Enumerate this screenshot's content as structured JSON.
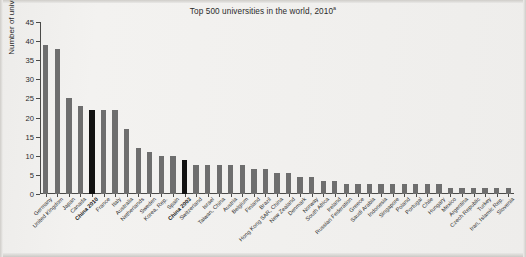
{
  "chart_data": {
    "type": "bar",
    "title": "Top 500 universities in the world, 2010",
    "title_superscript": "a",
    "xlabel": "",
    "ylabel": "Number of universities",
    "ylim": [
      0,
      45
    ],
    "ytick_labels": [
      "0",
      "5",
      "10",
      "15",
      "20",
      "25",
      "30",
      "35",
      "40",
      "45"
    ],
    "ytick_values": [
      0,
      5,
      10,
      15,
      20,
      25,
      30,
      35,
      40,
      45
    ],
    "grid": false,
    "legend": "none",
    "bar_color": "#6e6e6e",
    "highlight_color": "#121212",
    "categories": [
      "Germany",
      "United Kingdom",
      "Japan",
      "Canada",
      "China 2010",
      "France",
      "Italy",
      "Australia",
      "Netherlands",
      "Sweden",
      "Korea, Rep.",
      "Spain",
      "China 2003",
      "Switzerland",
      "Israel",
      "Taiwan, China",
      "Austria",
      "Belgium",
      "Finland",
      "Brazil",
      "Hong Kong SAR, China",
      "New Zealand",
      "Denmark",
      "Norway",
      "South Africa",
      "Ireland",
      "Russian Federation",
      "Greece",
      "Saudi Arabia",
      "Indonesia",
      "Singapore",
      "Poland",
      "Portugal",
      "Chile",
      "Hungary",
      "Mexico",
      "Argentina",
      "Czech Republic",
      "Turkey",
      "Iran, Islamic Rep.",
      "Slovenia"
    ],
    "values": [
      39,
      38,
      25,
      23,
      22,
      22,
      22,
      17,
      12,
      11,
      10,
      10,
      9,
      7.5,
      7.5,
      7.5,
      7.5,
      7.5,
      6.5,
      6.5,
      5.5,
      5.5,
      4.5,
      4.5,
      3.5,
      3.5,
      2.5,
      2.5,
      2.5,
      2.5,
      2.5,
      2.5,
      2.5,
      2.5,
      2.5,
      1.5,
      1.5,
      1.5,
      1.5,
      1.5,
      1.5
    ],
    "highlighted": [
      "China 2010",
      "China 2003"
    ]
  }
}
